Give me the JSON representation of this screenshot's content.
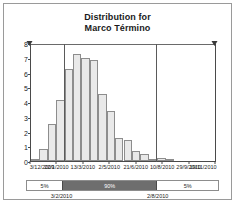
{
  "chart_data": {
    "type": "bar",
    "title": "Distribution for Marco Término",
    "title_line1": "Distribution for",
    "title_line2": "Marco Término",
    "xlabel": "",
    "ylabel": "",
    "ylim": [
      0,
      8
    ],
    "yticks": [
      0,
      1,
      2,
      3,
      4,
      5,
      6,
      7,
      8
    ],
    "ytick_labels": [
      "0",
      "1",
      "2",
      "3",
      "4",
      "5",
      "6",
      "7",
      "8"
    ],
    "xtick_labels": [
      "3/12/2009",
      "22/1/2010",
      "13/3/2010",
      "2/5/2010",
      "21/6/2010",
      "10/8/2010",
      "29/9/2010",
      "19/11/2010"
    ],
    "grid": false,
    "legend": null,
    "bin_count": 22,
    "values": [
      0.15,
      0.8,
      2.5,
      4.2,
      6.3,
      7.35,
      7.05,
      6.9,
      4.55,
      3.45,
      1.55,
      1.45,
      0.7,
      0.5,
      0.1,
      0.2,
      0.05,
      0.0,
      0.0,
      0.0,
      0.0,
      0.0
    ],
    "certainty_lines": [
      {
        "name": "lower-bound",
        "position_pct": 18.4,
        "date": "3/2/2010"
      },
      {
        "name": "upper-bound",
        "position_pct": 68.2,
        "date": "2/8/2010"
      }
    ],
    "annotations": []
  },
  "certainty_band": {
    "segments": [
      {
        "name": "left-tail",
        "label": "5%",
        "width_pct": 18.4
      },
      {
        "name": "center",
        "label": "90%",
        "width_pct": 49.8
      },
      {
        "name": "right-tail",
        "label": "5%",
        "width_pct": 31.8
      }
    ],
    "boundaries": [
      {
        "label": "3/2/2010",
        "position_pct": 18.4
      },
      {
        "label": "2/8/2010",
        "position_pct": 68.2
      }
    ]
  },
  "colors": {
    "bar_fill": "#e9e9e9",
    "bar_stroke": "#8d8d8d",
    "axis": "#4a4a4a",
    "band_mid": "#6e6e6e",
    "panel_border": "#9a9a9a",
    "text": "#1a1a1a"
  }
}
